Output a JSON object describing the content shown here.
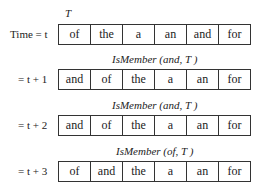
{
  "rows": [
    {
      "label": "Time = t",
      "caption": "T",
      "cells": [
        "of",
        "the",
        "a",
        "an",
        "and",
        "for"
      ]
    },
    {
      "label": "= t + 1",
      "caption": "IsMember (and, T )",
      "cells": [
        "and",
        "of",
        "the",
        "a",
        "an",
        "for"
      ]
    },
    {
      "label": "= t + 2",
      "caption": "IsMember (and, T )",
      "cells": [
        "and",
        "of",
        "the",
        "a",
        "an",
        "for"
      ]
    },
    {
      "label": "= t + 3",
      "caption": "IsMember (of, T )",
      "cells": [
        "of",
        "and",
        "the",
        "a",
        "an",
        "for"
      ]
    }
  ]
}
